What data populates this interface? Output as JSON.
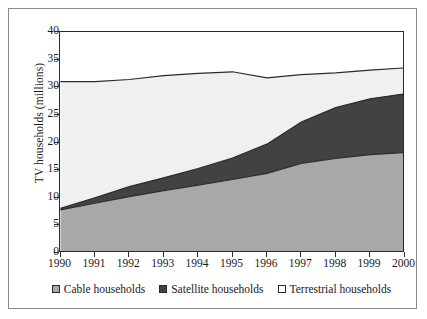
{
  "chart_data": {
    "type": "area",
    "title": "",
    "subtitle": "",
    "xlabel": "",
    "ylabel": "TV households (millions)",
    "stacked": true,
    "grid": false,
    "legend_position": "bottom",
    "xlim": [
      1990,
      2000
    ],
    "ylim": [
      0,
      40
    ],
    "ytick_step": 5,
    "categories": [
      "1990",
      "1991",
      "1992",
      "1993",
      "1994",
      "1995",
      "1996",
      "1997",
      "1998",
      "1999",
      "2000"
    ],
    "x": [
      1990,
      1991,
      1992,
      1993,
      1994,
      1995,
      1996,
      1997,
      1998,
      1999,
      2000
    ],
    "yticks": [
      "0",
      "5",
      "10",
      "15",
      "20",
      "25",
      "30",
      "35",
      "40"
    ],
    "series": [
      {
        "name": "Cable households",
        "color": "#a8a8a8",
        "values": [
          7.8,
          9.0,
          10.2,
          11.3,
          12.3,
          13.3,
          14.4,
          16.2,
          17.1,
          17.8,
          18.2
        ]
      },
      {
        "name": "Satellite households",
        "color": "#424242",
        "values": [
          0.3,
          1.0,
          1.8,
          2.3,
          3.0,
          3.9,
          5.3,
          7.5,
          9.2,
          10.1,
          10.6
        ]
      },
      {
        "name": "Terrestrial households",
        "color": "#f0f0f0",
        "values": [
          22.9,
          21.0,
          19.4,
          18.5,
          17.2,
          15.6,
          12.0,
          8.6,
          6.3,
          5.2,
          4.7
        ]
      }
    ],
    "stack_tops": {
      "cable": [
        7.8,
        9.0,
        10.2,
        11.3,
        12.3,
        13.3,
        14.4,
        16.2,
        17.1,
        17.8,
        18.2
      ],
      "cable_plus_satellite": [
        8.1,
        10.0,
        12.0,
        13.6,
        15.3,
        17.2,
        19.7,
        23.7,
        26.3,
        27.9,
        28.8
      ],
      "total": [
        31.0,
        31.0,
        31.4,
        32.1,
        32.5,
        32.8,
        31.7,
        32.3,
        32.6,
        33.1,
        33.5
      ]
    },
    "annotations": []
  },
  "axes": {
    "ylabel": "TV households (millions)",
    "ytick_labels": [
      "40",
      "35",
      "30",
      "25",
      "20",
      "15",
      "10",
      "5",
      "0"
    ],
    "xtick_labels": [
      "1990",
      "1991",
      "1992",
      "1993",
      "1994",
      "1995",
      "1996",
      "1997",
      "1998",
      "1999",
      "2000"
    ]
  },
  "legend": {
    "items": [
      {
        "label": "Cable households",
        "color": "#a8a8a8"
      },
      {
        "label": "Satellite households",
        "color": "#424242"
      },
      {
        "label": "Terrestrial households",
        "color": "#ffffff"
      }
    ]
  },
  "colors": {
    "cable": "#a8a8a8",
    "satellite": "#424242",
    "terrestrial": "#f0f0f0",
    "axis": "#2a2a2a",
    "frame": "#8a8a8a",
    "background": "#ffffff"
  }
}
